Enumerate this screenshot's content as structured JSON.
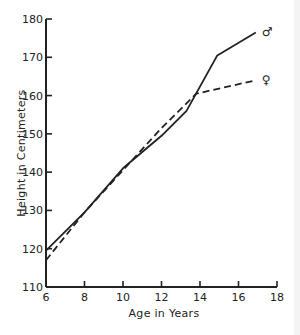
{
  "chart_data": {
    "type": "line",
    "title": "",
    "xlabel": "Age in Years",
    "ylabel": "Height in Centimeters",
    "xlim": [
      6,
      18
    ],
    "ylim": [
      110,
      180
    ],
    "xticks": [
      6,
      8,
      10,
      12,
      14,
      16,
      18
    ],
    "yticks": [
      110,
      120,
      130,
      140,
      150,
      160,
      170,
      180
    ],
    "grid": false,
    "legend_position": "inline, at line ends (right)",
    "series": [
      {
        "name": "Male",
        "symbol": "♂",
        "style": "solid",
        "x": [
          6,
          8,
          10,
          12,
          13.3,
          14.9,
          16.9
        ],
        "y": [
          119.5,
          129.5,
          141,
          149.5,
          156,
          170.5,
          176.5
        ]
      },
      {
        "name": "Female",
        "symbol": "♀",
        "style": "dashed",
        "x": [
          6,
          8,
          10,
          12,
          13.8,
          16.9
        ],
        "y": [
          117,
          129.5,
          140.5,
          151.5,
          160.5,
          164
        ]
      }
    ]
  },
  "colors": {
    "line": "#222222",
    "background": "#ffffff"
  }
}
